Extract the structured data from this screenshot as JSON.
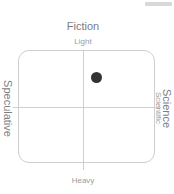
{
  "canvas": {
    "width": 174,
    "height": 194,
    "background": "#ffffff"
  },
  "top_strip": {
    "name": "toolbar-strip",
    "color": "#d8d8d8"
  },
  "chart_data": {
    "type": "scatter",
    "title": "Fiction",
    "subtitle": "Light",
    "xlabel": "",
    "ylabel": "",
    "grid": false,
    "legend_position": "none",
    "axes": {
      "top_major": "Fiction",
      "top_minor": "Light",
      "bottom_major": "Heavy",
      "left_major": "Speculative",
      "right_major": "Science",
      "right_minor": "Scientific"
    },
    "xlim": [
      -1,
      1
    ],
    "ylim": [
      -1,
      1
    ],
    "quadrant_labels": {
      "top": "Light",
      "bottom": "Heavy",
      "left": "Speculative",
      "right": "Scientific"
    },
    "points": [
      {
        "label": "",
        "x": 0.14,
        "y": 0.51,
        "color": "#333333",
        "size": 11
      }
    ]
  },
  "frame": {
    "border_color": "#cfcfcf",
    "axis_color": "#cfcfcf"
  }
}
